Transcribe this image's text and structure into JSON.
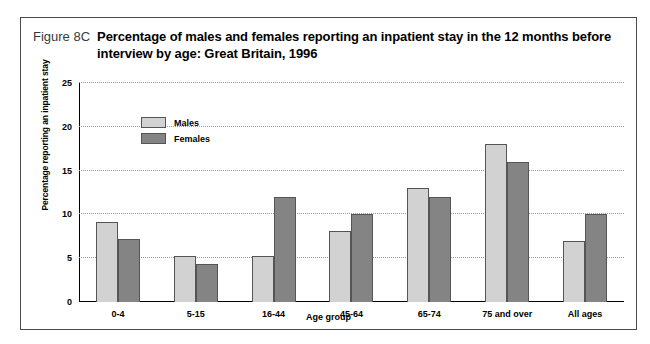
{
  "figure": {
    "number": "Figure 8C",
    "title": "Percentage of males and females reporting an inpatient stay in the 12 months before interview by age: Great Britain, 1996"
  },
  "chart_data": {
    "type": "bar",
    "title": "Percentage of males and females reporting an inpatient stay in the 12 months before interview by age: Great Britain, 1996",
    "categories": [
      "0-4",
      "5-15",
      "16-44",
      "45-64",
      "65-74",
      "75 and over",
      "All ages"
    ],
    "series": [
      {
        "name": "Males",
        "color": "#d2d2d2",
        "values": [
          9.1,
          5.3,
          5.3,
          8.1,
          13.0,
          18.0,
          7.0
        ]
      },
      {
        "name": "Females",
        "color": "#848484",
        "values": [
          7.2,
          4.3,
          12.0,
          10.0,
          12.0,
          16.0,
          10.0
        ]
      }
    ],
    "xlabel": "Age group",
    "ylabel": "Percentage reporting an inpatient stay",
    "ylim": [
      0,
      25
    ],
    "yticks": [
      0,
      5,
      10,
      15,
      20,
      25
    ],
    "grid": true,
    "legend_position": "top-left-inside"
  }
}
